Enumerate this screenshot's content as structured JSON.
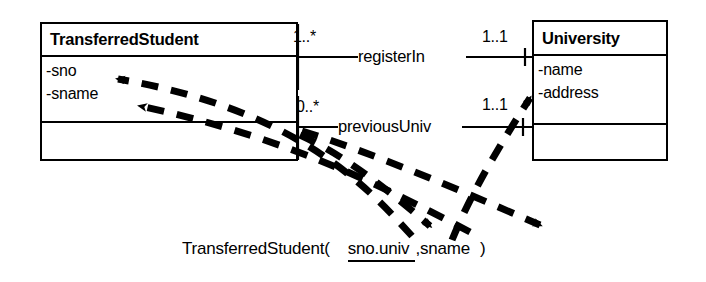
{
  "diagram": {
    "stroke_color": "#000000",
    "background_color": "#ffffff"
  },
  "classes": [
    {
      "id": "transferred-student",
      "name": "TransferredStudent",
      "attributes": [
        "-sno",
        "-sname"
      ],
      "operations": []
    },
    {
      "id": "university",
      "name": "University",
      "attributes": [
        "-name",
        "-address"
      ],
      "operations": []
    }
  ],
  "associations": [
    {
      "id": "register-in",
      "label": "registerIn",
      "source_multiplicity": "1..*",
      "target_multiplicity": "1..1"
    },
    {
      "id": "previous-univ",
      "label": "previousUniv",
      "source_multiplicity": "0..*",
      "target_multiplicity": "1..1"
    }
  ],
  "schema": {
    "relation_name": "TransferredStudent(",
    "primary_key": "sno.univ",
    "rest_attributes": ",sname",
    "close_paren": ")"
  },
  "mappings": [
    {
      "id": "map-sno",
      "from": "schema.primary_key.sno",
      "to": "-sno",
      "style": "dashed-arrow"
    },
    {
      "id": "map-sname",
      "from": "schema.rest.sname",
      "to": "-sname",
      "style": "dashed-arrow"
    },
    {
      "id": "map-univ",
      "from": "schema.primary_key.univ",
      "to": "-name",
      "style": "dashed-arrow"
    },
    {
      "id": "map-key-down",
      "from": "-sno",
      "to": "schema.primary_key",
      "style": "dashed-arrow"
    },
    {
      "id": "map-attr-down",
      "from": "-sname",
      "to": "schema.rest",
      "style": "dashed-arrow"
    }
  ]
}
